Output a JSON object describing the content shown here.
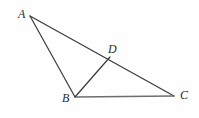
{
  "figure": {
    "background_color": "#fefefe",
    "stroke_color": "#3a3a3a",
    "stroke_color_base": "#6e6e6e",
    "stroke_width": 1.1,
    "width": 199,
    "height": 118,
    "points": [
      {
        "name": "A",
        "label": "A",
        "x": 30,
        "y": 16,
        "label_x": 18,
        "label_y": 8
      },
      {
        "name": "B",
        "label": "B",
        "x": 75,
        "y": 97,
        "label_x": 62,
        "label_y": 92
      },
      {
        "name": "C",
        "label": "C",
        "x": 174,
        "y": 96,
        "label_x": 180,
        "label_y": 89
      },
      {
        "name": "D",
        "label": "D",
        "x": 106,
        "y": 60,
        "label_x": 108,
        "label_y": 43
      }
    ],
    "segments": [
      {
        "name": "segment-AB",
        "from": "A",
        "to": "B",
        "x1": 30,
        "y1": 16,
        "x2": 75,
        "y2": 97
      },
      {
        "name": "segment-AC",
        "from": "A",
        "to": "C",
        "x1": 30,
        "y1": 16,
        "x2": 174,
        "y2": 96
      },
      {
        "name": "segment-BC",
        "from": "B",
        "to": "C",
        "x1": 76,
        "y1": 97,
        "x2": 174,
        "y2": 96
      },
      {
        "name": "segment-BD",
        "from": "B",
        "to": "D",
        "x1": 75,
        "y1": 97,
        "x2": 110,
        "y2": 57
      }
    ]
  }
}
